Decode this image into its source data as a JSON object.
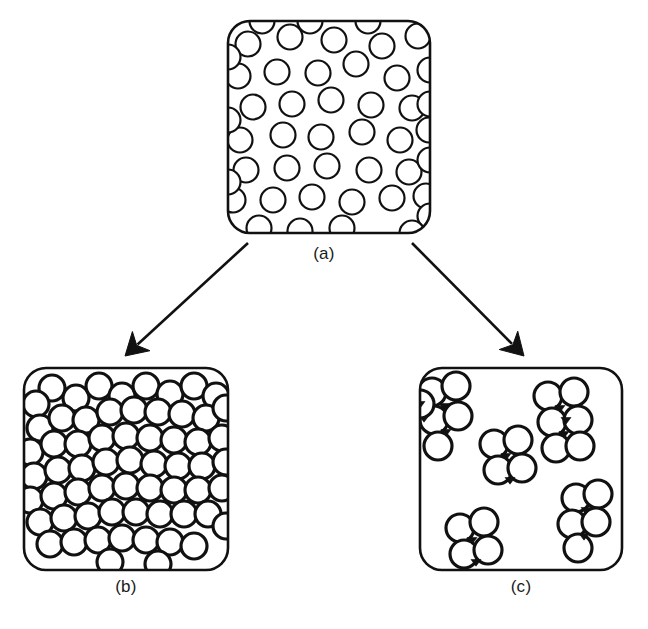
{
  "figure": {
    "background_color": "#ffffff",
    "ink_color": "#111111",
    "width": 648,
    "height": 629
  },
  "panels": [
    {
      "id": "a",
      "caption": "(a)",
      "state_name": "stable dispersion",
      "description": "Rounded square box densely filled with separate, non-touching circles representing individually dispersed particles.",
      "box": {
        "x": 228,
        "y": 21,
        "width": 202,
        "height": 212,
        "corner_radius": 22
      },
      "particle_count": 46,
      "particle_radius": 12.5,
      "stroke_width": 2.2,
      "particles": [
        [
          248,
          44
        ],
        [
          290,
          37
        ],
        [
          334,
          40
        ],
        [
          382,
          46
        ],
        [
          418,
          36
        ],
        [
          238,
          76
        ],
        [
          277,
          72
        ],
        [
          318,
          73
        ],
        [
          356,
          64
        ],
        [
          397,
          78
        ],
        [
          430,
          70
        ],
        [
          253,
          107
        ],
        [
          292,
          104
        ],
        [
          331,
          100
        ],
        [
          371,
          105
        ],
        [
          412,
          108
        ],
        [
          240,
          140
        ],
        [
          283,
          135
        ],
        [
          321,
          137
        ],
        [
          362,
          132
        ],
        [
          400,
          140
        ],
        [
          429,
          130
        ],
        [
          246,
          170
        ],
        [
          287,
          168
        ],
        [
          327,
          166
        ],
        [
          369,
          170
        ],
        [
          409,
          172
        ],
        [
          233,
          200
        ],
        [
          273,
          200
        ],
        [
          312,
          197
        ],
        [
          352,
          202
        ],
        [
          392,
          198
        ],
        [
          426,
          196
        ],
        [
          259,
          228
        ],
        [
          300,
          231
        ],
        [
          342,
          228
        ],
        [
          228,
          57
        ],
        [
          228,
          120
        ],
        [
          228,
          182
        ],
        [
          430,
          104
        ],
        [
          430,
          160
        ],
        [
          430,
          216
        ],
        [
          262,
          21
        ],
        [
          310,
          21
        ],
        [
          368,
          21
        ],
        [
          412,
          233
        ]
      ]
    },
    {
      "id": "b",
      "caption": "(b)",
      "state_name": "percolating network / gel",
      "description": "Rounded square box in which circles touch edge-to-edge forming a continuous connected network spanning the box.",
      "box": {
        "x": 24,
        "y": 368,
        "width": 204,
        "height": 202,
        "corner_radius": 22
      },
      "particle_count": 63,
      "particle_radius": 13,
      "stroke_width": 3.2,
      "particles": [
        [
          52,
          388
        ],
        [
          76,
          398
        ],
        [
          99,
          386
        ],
        [
          122,
          396
        ],
        [
          146,
          386
        ],
        [
          170,
          394
        ],
        [
          194,
          386
        ],
        [
          216,
          396
        ],
        [
          36,
          404
        ],
        [
          40,
          428
        ],
        [
          62,
          418
        ],
        [
          86,
          420
        ],
        [
          110,
          412
        ],
        [
          134,
          410
        ],
        [
          158,
          412
        ],
        [
          182,
          414
        ],
        [
          206,
          418
        ],
        [
          226,
          408
        ],
        [
          30,
          452
        ],
        [
          54,
          444
        ],
        [
          78,
          444
        ],
        [
          102,
          438
        ],
        [
          126,
          436
        ],
        [
          150,
          438
        ],
        [
          174,
          440
        ],
        [
          198,
          442
        ],
        [
          222,
          438
        ],
        [
          34,
          476
        ],
        [
          58,
          470
        ],
        [
          82,
          468
        ],
        [
          106,
          462
        ],
        [
          130,
          460
        ],
        [
          154,
          464
        ],
        [
          178,
          466
        ],
        [
          202,
          466
        ],
        [
          226,
          462
        ],
        [
          30,
          500
        ],
        [
          54,
          496
        ],
        [
          78,
          492
        ],
        [
          102,
          488
        ],
        [
          126,
          486
        ],
        [
          150,
          488
        ],
        [
          174,
          490
        ],
        [
          198,
          490
        ],
        [
          222,
          488
        ],
        [
          40,
          522
        ],
        [
          64,
          518
        ],
        [
          88,
          516
        ],
        [
          112,
          512
        ],
        [
          136,
          512
        ],
        [
          160,
          514
        ],
        [
          184,
          514
        ],
        [
          208,
          514
        ],
        [
          226,
          526
        ],
        [
          50,
          544
        ],
        [
          74,
          542
        ],
        [
          98,
          540
        ],
        [
          122,
          538
        ],
        [
          146,
          540
        ],
        [
          170,
          542
        ],
        [
          194,
          546
        ],
        [
          110,
          562
        ],
        [
          158,
          564
        ]
      ]
    },
    {
      "id": "c",
      "caption": "(c)",
      "state_name": "flocculated / aggregated clusters",
      "description": "Rounded square box containing several isolated compact clusters of touching circles, each with small filled triangular interstitial voids between contacting particles.",
      "box": {
        "x": 420,
        "y": 368,
        "width": 202,
        "height": 202,
        "corner_radius": 22
      },
      "particle_radius": 14,
      "stroke_width": 3.2,
      "cluster_count": 6,
      "clusters": [
        {
          "name": "top-left-cluster",
          "particles": [
            [
              432,
              392
            ],
            [
              456,
              386
            ],
            [
              434,
              420
            ],
            [
              458,
              416
            ],
            [
              438,
              446
            ]
          ],
          "triangles": [
            [
              444,
              406
            ],
            [
              446,
              432
            ],
            [
              424,
              418
            ]
          ]
        },
        {
          "name": "top-right-cluster",
          "particles": [
            [
              548,
              396
            ],
            [
              574,
              392
            ],
            [
              552,
              422
            ],
            [
              578,
              420
            ],
            [
              556,
              448
            ],
            [
              580,
              446
            ]
          ],
          "triangles": [
            [
              560,
              408
            ],
            [
              564,
              434
            ],
            [
              566,
              420
            ]
          ]
        },
        {
          "name": "center-cluster",
          "particles": [
            [
              494,
              444
            ],
            [
              518,
              440
            ],
            [
              498,
              470
            ],
            [
              522,
              468
            ]
          ],
          "triangles": [
            [
              506,
              456
            ],
            [
              510,
              480
            ]
          ]
        },
        {
          "name": "right-lower-cluster",
          "particles": [
            [
              576,
              498
            ],
            [
              598,
              494
            ],
            [
              572,
              524
            ],
            [
              596,
              522
            ],
            [
              578,
              548
            ]
          ],
          "triangles": [
            [
              586,
              510
            ],
            [
              584,
              536
            ]
          ]
        },
        {
          "name": "bottom-left-cluster",
          "particles": [
            [
              460,
              528
            ],
            [
              484,
              522
            ],
            [
              464,
              554
            ],
            [
              488,
              550
            ]
          ],
          "triangles": [
            [
              472,
              540
            ],
            [
              476,
              562
            ]
          ]
        },
        {
          "name": "edge-cluster",
          "particles": [
            [
              420,
              404
            ]
          ],
          "triangles": [
            [
              420,
              404
            ]
          ]
        }
      ]
    }
  ],
  "arrows": [
    {
      "name": "arrow-to-b",
      "from_panel": "a",
      "to_panel": "b",
      "start": [
        248,
        243
      ],
      "end": [
        125,
        356
      ],
      "stroke_width": 2.6,
      "head_length": 22,
      "head_width": 13
    },
    {
      "name": "arrow-to-c",
      "from_panel": "a",
      "to_panel": "c",
      "start": [
        412,
        243
      ],
      "end": [
        524,
        356
      ],
      "stroke_width": 2.6,
      "head_length": 22,
      "head_width": 13
    }
  ]
}
